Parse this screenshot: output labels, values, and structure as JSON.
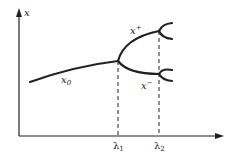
{
  "diagram": {
    "axes": {
      "y_label": "x",
      "x_ticks": [
        {
          "base": "λ",
          "sub": "1"
        },
        {
          "base": "λ",
          "sub": "2"
        }
      ]
    },
    "branches": {
      "stable": {
        "base": "x",
        "sub": "0"
      },
      "upper": {
        "base": "x",
        "sup": "+"
      },
      "lower": {
        "base": "x",
        "sup": "−"
      }
    },
    "colors": {
      "line": "#222222",
      "background": "#ffffff"
    }
  }
}
